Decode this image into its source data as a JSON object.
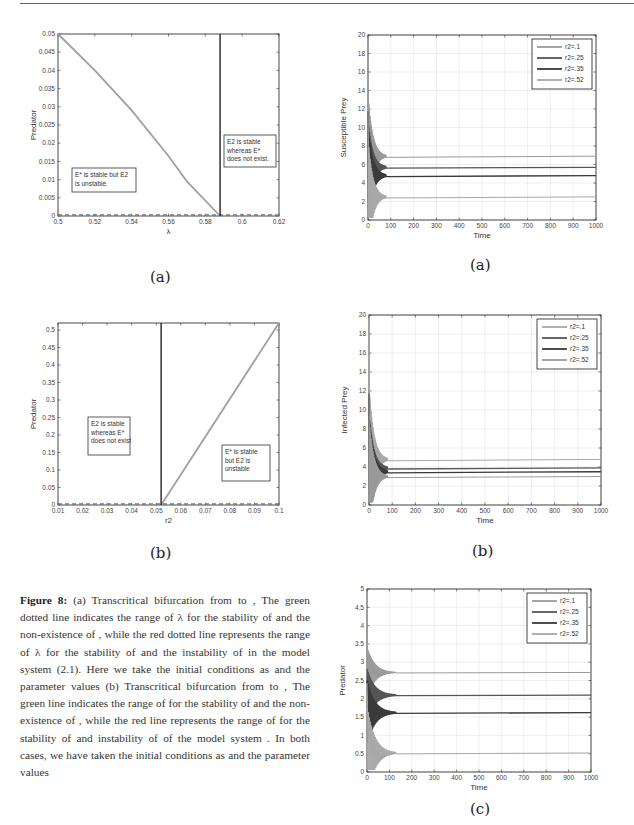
{
  "figure_number_label": "Figure 8:",
  "caption_text": "(a) Transcritical bifurcation from  to , The green dotted line indicates the range of λ for the stability of  and the non-existence of , while the red dotted line represents the range of λ for the stability of  and the instability of  in the model system (2.1). Here we take the initial conditions as  and the parameter values  (b) Transcritical bifurcation from  to , The green line indicates the range of  for the stability of  and the non-existence of , while the red line represents the range of  for the stability of  and instability of  of the model system . In both cases, we have taken the initial conditions as and the parameter values",
  "sublabels": {
    "left_a": "(a)",
    "left_b": "(b)",
    "right_a": "(a)",
    "right_b": "(b)",
    "right_c": "(c)"
  },
  "chart_data": [
    {
      "id": "left_a",
      "type": "line",
      "title": "",
      "xlabel": "λ",
      "ylabel": "Predator",
      "xlim": [
        0.5,
        0.62
      ],
      "ylim": [
        0,
        0.05
      ],
      "xticks": [
        "0.5",
        "0.52",
        "0.54",
        "0.56",
        "0.58",
        "0.6",
        "0.62"
      ],
      "yticks": [
        "0",
        "0.005",
        "0.01",
        "0.015",
        "0.02",
        "0.025",
        "0.03",
        "0.035",
        "0.04",
        "0.045",
        "0.05"
      ],
      "grid": false,
      "series": [
        {
          "name": "E* branch (stable)",
          "style": "solid",
          "x": [
            0.5,
            0.52,
            0.54,
            0.56,
            0.57,
            0.588
          ],
          "y": [
            0.05,
            0.04,
            0.029,
            0.0165,
            0.0095,
            0.0
          ]
        },
        {
          "name": "E2 branch",
          "style": "dashed",
          "x": [
            0.5,
            0.62
          ],
          "y": [
            0,
            0
          ]
        }
      ],
      "vertical_line": {
        "x": 0.588
      },
      "annotations": [
        {
          "text_lines": [
            "E* is stable but E2",
            "is unstable."
          ]
        },
        {
          "text_lines": [
            "E2 is stable",
            "whereas E*",
            "does not exist."
          ]
        }
      ]
    },
    {
      "id": "left_b",
      "type": "line",
      "title": "",
      "xlabel": "r2",
      "ylabel": "Predator",
      "xlim": [
        0.01,
        0.1
      ],
      "ylim": [
        0,
        0.52
      ],
      "xticks": [
        "0.01",
        "0.02",
        "0.03",
        "0.04",
        "0.05",
        "0.06",
        "0.07",
        "0.08",
        "0.09",
        "0.1"
      ],
      "yticks": [
        "0",
        "0.05",
        "0.1",
        "0.15",
        "0.2",
        "0.25",
        "0.3",
        "0.35",
        "0.4",
        "0.45",
        "0.5"
      ],
      "grid": false,
      "series": [
        {
          "name": "E* branch (stable)",
          "style": "solid",
          "x": [
            0.052,
            0.1
          ],
          "y": [
            0.0,
            0.52
          ]
        },
        {
          "name": "E2 branch",
          "style": "dashed",
          "x": [
            0.01,
            0.1
          ],
          "y": [
            0,
            0
          ]
        }
      ],
      "vertical_line": {
        "x": 0.052
      },
      "annotations": [
        {
          "text_lines": [
            "E2 is stable",
            "whereas E*",
            "does not exist"
          ]
        },
        {
          "text_lines": [
            "E* is stable",
            "but E2 is",
            "unstable"
          ]
        }
      ]
    },
    {
      "id": "right_a",
      "type": "line",
      "title": "",
      "xlabel": "Time",
      "ylabel": "Susceptible Prey",
      "xlim": [
        0,
        1000
      ],
      "ylim": [
        0,
        20
      ],
      "xticks": [
        "0",
        "100",
        "200",
        "300",
        "400",
        "500",
        "600",
        "700",
        "800",
        "900",
        "1000"
      ],
      "yticks": [
        "0",
        "2",
        "4",
        "6",
        "8",
        "10",
        "12",
        "14",
        "16",
        "18",
        "20"
      ],
      "grid": true,
      "legend": {
        "position": "upper right",
        "entries": [
          "r2=.1",
          "r2=.25",
          "r2=.35",
          "r2=.52"
        ]
      },
      "series": [
        {
          "name": "r2=.1",
          "x": [
            0,
            1000
          ],
          "y": [
            6.9,
            6.9
          ],
          "color": "#9a9a9a"
        },
        {
          "name": "r2=.25",
          "x": [
            0,
            1000
          ],
          "y": [
            5.7,
            5.7
          ],
          "color": "#555555"
        },
        {
          "name": "r2=.35",
          "x": [
            0,
            1000
          ],
          "y": [
            4.8,
            4.8
          ],
          "color": "#3a3a3a"
        },
        {
          "name": "r2=.52",
          "x": [
            0,
            1000
          ],
          "y": [
            2.5,
            2.5
          ],
          "color": "#a8a8a8"
        }
      ],
      "initial_transient": {
        "t_range": [
          0,
          80
        ],
        "peak": 19.5
      }
    },
    {
      "id": "right_b",
      "type": "line",
      "title": "",
      "xlabel": "Time",
      "ylabel": "Infected Prey",
      "xlim": [
        0,
        1000
      ],
      "ylim": [
        0,
        20
      ],
      "xticks": [
        "0",
        "100",
        "200",
        "300",
        "400",
        "500",
        "600",
        "700",
        "800",
        "900",
        "1000"
      ],
      "yticks": [
        "0",
        "2",
        "4",
        "6",
        "8",
        "10",
        "12",
        "14",
        "16",
        "18",
        "20"
      ],
      "grid": true,
      "legend": {
        "position": "upper right",
        "entries": [
          "r2=.1",
          "r2=.25",
          "r2=.35",
          "r2=.52"
        ]
      },
      "series": [
        {
          "name": "r2=.1",
          "x": [
            0,
            1000
          ],
          "y": [
            4.8,
            4.8
          ],
          "color": "#a8a8a8"
        },
        {
          "name": "r2=.25",
          "x": [
            0,
            1000
          ],
          "y": [
            3.9,
            3.9
          ],
          "color": "#555555"
        },
        {
          "name": "r2=.35",
          "x": [
            0,
            1000
          ],
          "y": [
            3.5,
            3.5
          ],
          "color": "#3a3a3a"
        },
        {
          "name": "r2=.52",
          "x": [
            0,
            1000
          ],
          "y": [
            3.0,
            3.0
          ],
          "color": "#9a9a9a"
        }
      ],
      "initial_transient": {
        "t_range": [
          0,
          80
        ],
        "peak": 19.5
      }
    },
    {
      "id": "right_c",
      "type": "line",
      "title": "",
      "xlabel": "Time",
      "ylabel": "Predator",
      "xlim": [
        0,
        1000
      ],
      "ylim": [
        0,
        5
      ],
      "xticks": [
        "0",
        "100",
        "200",
        "300",
        "400",
        "500",
        "600",
        "700",
        "800",
        "900",
        "1000"
      ],
      "yticks": [
        "0",
        "0.5",
        "1",
        "1.5",
        "2",
        "2.5",
        "3",
        "3.5",
        "4",
        "4.5",
        "5"
      ],
      "grid": true,
      "legend": {
        "position": "upper right",
        "entries": [
          "r2=.1",
          "r2=.25",
          "r2=.35",
          "r2=.52"
        ]
      },
      "series": [
        {
          "name": "r2=.1",
          "x": [
            0,
            1000
          ],
          "y": [
            2.72,
            2.72
          ],
          "color": "#9a9a9a"
        },
        {
          "name": "r2=.25",
          "x": [
            0,
            1000
          ],
          "y": [
            2.1,
            2.1
          ],
          "color": "#555555"
        },
        {
          "name": "r2=.35",
          "x": [
            0,
            1000
          ],
          "y": [
            1.62,
            1.62
          ],
          "color": "#3a3a3a"
        },
        {
          "name": "r2=.52",
          "x": [
            0,
            1000
          ],
          "y": [
            0.52,
            0.52
          ],
          "color": "#a8a8a8"
        }
      ],
      "initial_transient": {
        "t_range": [
          0,
          130
        ],
        "peak": 4.05
      }
    }
  ]
}
